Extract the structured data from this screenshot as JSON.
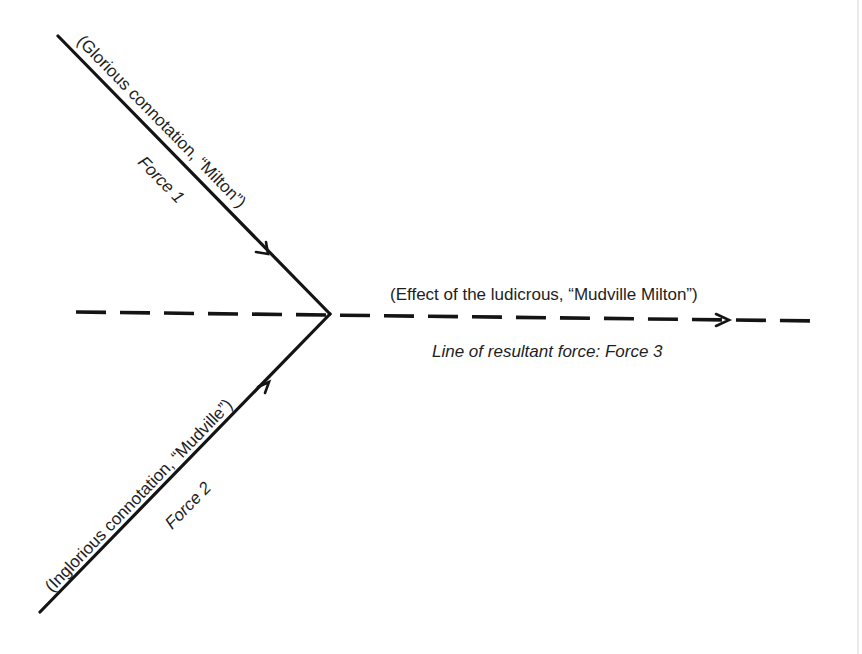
{
  "diagram": {
    "colors": {
      "ink": "#141414",
      "text": "#1e1e1e",
      "background": "#ffffff"
    },
    "force1": {
      "label": "(Glorious connotation, “Milton”)",
      "name": "Force 1",
      "direction": "down-right toward junction"
    },
    "force2": {
      "label": "(Inglorious connotation, “Mudville”)",
      "name": "Force 2",
      "direction": "up-right toward junction"
    },
    "resultant": {
      "label": "(Effect of the ludicrous, “Mudville Milton”)",
      "name": "Line of resultant force: Force 3",
      "style": "dashed"
    }
  }
}
